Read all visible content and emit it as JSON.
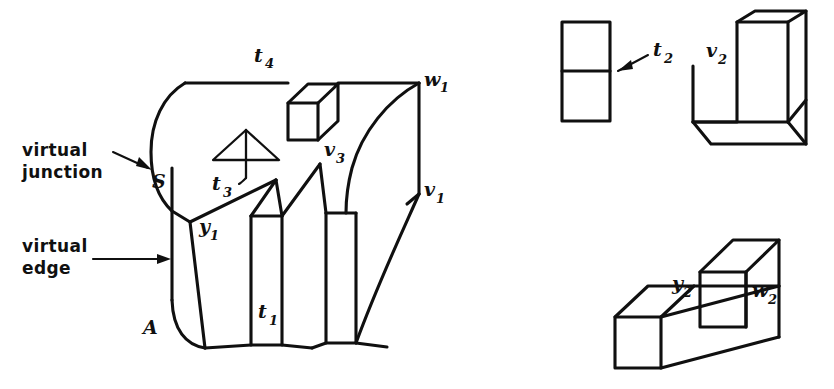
{
  "figure": {
    "background_color": "#ffffff",
    "ink_color": "#101010"
  },
  "annotations": [
    {
      "id": "virtual-junction",
      "line1": "virtual",
      "line2": "junction"
    },
    {
      "id": "virtual-edge",
      "line1": "virtual",
      "line2": "edge"
    }
  ],
  "labels": {
    "main_object": [
      {
        "id": "t4",
        "base": "t",
        "sub": "4"
      },
      {
        "id": "w1",
        "base": "w",
        "sub": "1"
      },
      {
        "id": "v3",
        "base": "v",
        "sub": "3"
      },
      {
        "id": "v1",
        "base": "v",
        "sub": "1"
      },
      {
        "id": "t3",
        "base": "t",
        "sub": "3"
      },
      {
        "id": "S",
        "base": "S",
        "sub": ""
      },
      {
        "id": "y1",
        "base": "y",
        "sub": "1"
      },
      {
        "id": "t1",
        "base": "t",
        "sub": "1"
      },
      {
        "id": "A",
        "base": "A",
        "sub": ""
      }
    ],
    "t2_object": [
      {
        "id": "t2",
        "base": "t",
        "sub": "2"
      }
    ],
    "v2_object": [
      {
        "id": "v2",
        "base": "v",
        "sub": "2"
      }
    ],
    "stepped_object": [
      {
        "id": "y2",
        "base": "y",
        "sub": "2"
      },
      {
        "id": "w2",
        "base": "w",
        "sub": "2"
      }
    ]
  },
  "objects": [
    {
      "id": "main-curved-object",
      "name": "main curved object with slots"
    },
    {
      "id": "t2-rectangle",
      "name": "divided rectangle"
    },
    {
      "id": "v2-l-block",
      "name": "L-shaped block"
    },
    {
      "id": "stepped-block",
      "name": "stepped block"
    }
  ]
}
